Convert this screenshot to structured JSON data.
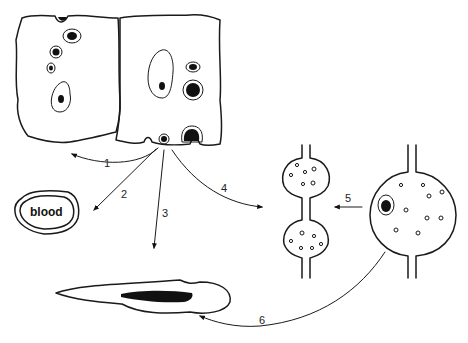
{
  "diagram": {
    "type": "schematic illustration of cell migration pathways",
    "nodes": [
      {
        "id": "tissue",
        "label": "",
        "description": "Two adjacent cells/tissue blocks with stained inclusions; origin cell at bottom"
      },
      {
        "id": "blood",
        "label": "blood"
      },
      {
        "id": "elongated-cell",
        "label": "",
        "description": "Elongated cell with dark elongated nucleus"
      },
      {
        "id": "vessel-pair",
        "label": "",
        "description": "Vessel with two bulbous chambers containing small granules"
      },
      {
        "id": "vessel-large",
        "label": "",
        "description": "Vessel with one large chamber containing granules and a dark nucleus"
      }
    ],
    "arrows": [
      {
        "label": "1",
        "from": "tissue",
        "to": "left"
      },
      {
        "label": "2",
        "from": "tissue",
        "to": "blood"
      },
      {
        "label": "3",
        "from": "tissue",
        "to": "elongated-cell"
      },
      {
        "label": "4",
        "from": "tissue",
        "to": "vessel-pair"
      },
      {
        "label": "5",
        "from": "vessel-large",
        "to": "vessel-pair"
      },
      {
        "label": "6",
        "from": "vessel-large",
        "to": "elongated-cell"
      }
    ]
  }
}
